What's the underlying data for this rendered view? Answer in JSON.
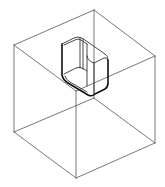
{
  "diagram": {
    "type": "isometric-wireframe",
    "colors": {
      "background": "#ffffff",
      "edge": "#555555",
      "pocket": "#333333",
      "pocket_bold": "#111111"
    },
    "cube": {
      "vertices": {
        "top_back": [
          94,
          10
        ],
        "top_left": [
          14,
          45
        ],
        "top_right": [
          155,
          56
        ],
        "top_front": [
          76,
          91
        ],
        "bottom_back": [
          94,
          98
        ],
        "bottom_left": [
          14,
          132
        ],
        "bottom_right": [
          155,
          143
        ],
        "bottom_front": [
          76,
          178
        ]
      }
    },
    "pocket": {
      "shape": "rounded-rectangle-prism",
      "outline": "M62,44 L62,75 Q63,80 68,83 L88,95 Q92,97 95,94 L107,87 Q108,86 108,82 L108,60"
    }
  }
}
